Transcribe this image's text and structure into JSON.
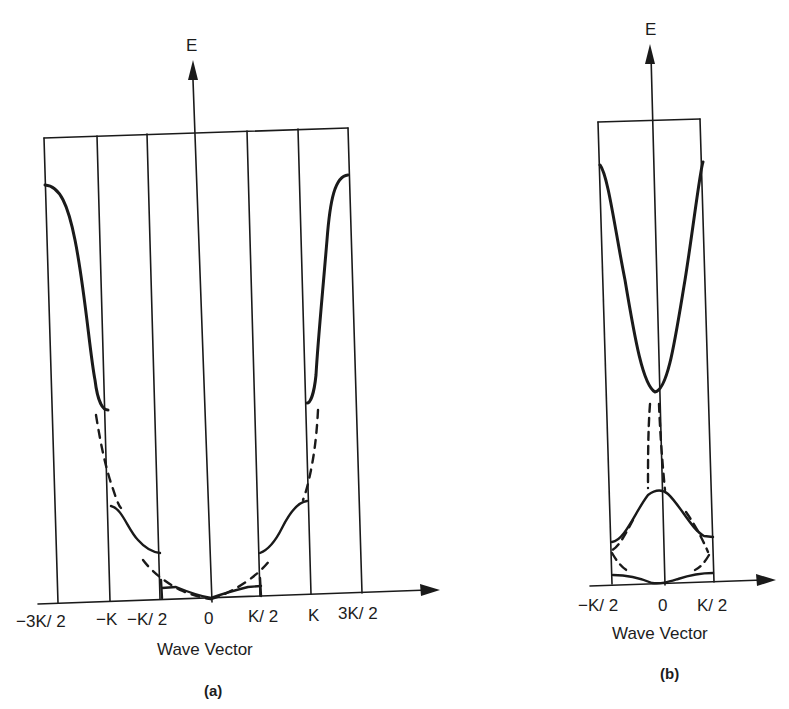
{
  "figure": {
    "panel_a": {
      "caption": "(a)",
      "y_axis_label": "E",
      "x_axis_label": "Wave Vector",
      "x_ticks": [
        "−3K/ 2",
        "−K",
        "−K/ 2",
        "0",
        "K/ 2",
        "K",
        "3K/ 2"
      ],
      "description": "Extended-zone scheme: solid energy bands with gaps at zone boundaries; dashed free-electron parabola"
    },
    "panel_b": {
      "caption": "(b)",
      "y_axis_label": "E",
      "x_axis_label": "Wave Vector",
      "x_ticks": [
        "−K/ 2",
        "0",
        "K/ 2"
      ],
      "description": "Reduced-zone scheme: bands folded into first Brillouin zone; dashed folded free-electron curves"
    },
    "colors": {
      "line": "#1a1a1a",
      "background": "#ffffff"
    }
  }
}
